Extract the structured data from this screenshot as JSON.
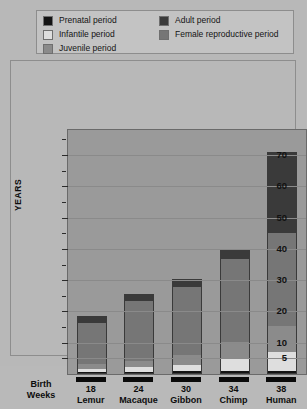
{
  "legend": {
    "items": [
      {
        "label": "Prenatal period",
        "color": "#141414",
        "key": "prenatal"
      },
      {
        "label": "Infantile period",
        "color": "#dedede",
        "key": "infantile"
      },
      {
        "label": "Juvenile period",
        "color": "#8b8b8b",
        "key": "juvenile"
      },
      {
        "label": "Adult period",
        "color": "#3a3a3a",
        "key": "adult"
      },
      {
        "label": "Female reproductive period",
        "color": "#767676",
        "key": "female_reproductive"
      }
    ]
  },
  "axis": {
    "y_title": "YEARS",
    "y_ticks": [
      5,
      10,
      20,
      30,
      40,
      50,
      60,
      70
    ],
    "y_minor_ticks": [
      15,
      25,
      35,
      45,
      55,
      65,
      75
    ],
    "y_min": 0,
    "y_max": 78,
    "x_corner_label_line1": "Birth",
    "x_corner_label_line2": "Weeks"
  },
  "chart_data": {
    "type": "bar",
    "title": "",
    "xlabel": "",
    "ylabel": "YEARS",
    "ylim": [
      0,
      78
    ],
    "grid": true,
    "legend_position": "top",
    "stacked": true,
    "categories": [
      "Lemur",
      "Macaque",
      "Gibbon",
      "Chimp",
      "Human"
    ],
    "gestation_weeks": [
      "18",
      "24",
      "30",
      "34",
      "38"
    ],
    "series": [
      {
        "name": "Prenatal period",
        "color": "#141414",
        "values": [
          0.35,
          0.46,
          0.58,
          0.65,
          0.73
        ]
      },
      {
        "name": "Infantile period",
        "color": "#dedede",
        "values": [
          1.0,
          1.6,
          2.2,
          4.0,
          6.0
        ]
      },
      {
        "name": "Juvenile period",
        "color": "#8b8b8b",
        "values": [
          1.5,
          2.0,
          3.0,
          5.5,
          8.5
        ]
      },
      {
        "name": "Female reproductive period",
        "color": "#767676",
        "values": [
          13.5,
          19.5,
          22.5,
          27.0,
          30.0
        ]
      },
      {
        "name": "Adult period",
        "color": "#3a3a3a",
        "values": [
          2.0,
          2.0,
          2.5,
          3.0,
          26.0
        ]
      }
    ],
    "totals": [
      18.5,
      25.5,
      30.5,
      40.0,
      71.0
    ],
    "annotations": "Stacked bars show life-history stage durations in years for five primates; x-axis also gives gestation length in weeks."
  }
}
